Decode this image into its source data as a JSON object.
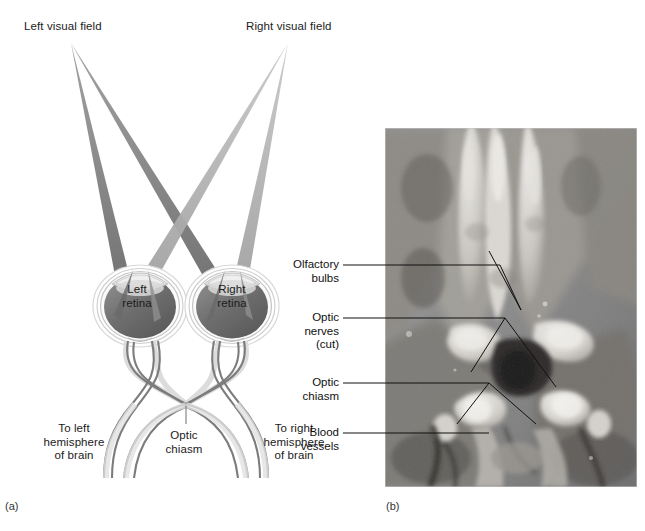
{
  "figure": {
    "panel_a_tag": "(a)",
    "panel_b_tag": "(b)",
    "credit": "Dr. Dana Copeland"
  },
  "diagram": {
    "labels": {
      "left_visual_field": "Left visual field",
      "right_visual_field": "Right visual field",
      "left_retina": "Left\nretina",
      "right_retina": "Right\nretina",
      "to_left_hemisphere": "To left\nhemisphere\nof brain",
      "optic_chiasm": "Optic\nchiasm",
      "to_right_hemisphere": "To right\nhemisphere\nof brain"
    },
    "colors": {
      "left_field_ray": "#6f6f6f",
      "right_field_ray": "#a9a9a9",
      "retina_fill": "#6e6e6e",
      "nerve_stroke": "#7a7a7a",
      "eye_outline": "#bdbdbd",
      "text": "#1b1b1b"
    }
  },
  "photo": {
    "labels": [
      {
        "id": "olfactory-bulbs",
        "text": "Olfactory\nbulbs"
      },
      {
        "id": "optic-nerves-cut",
        "text": "Optic\nnerves\n(cut)"
      },
      {
        "id": "optic-chiasm",
        "text": "Optic\nchiasm"
      },
      {
        "id": "blood-vessels",
        "text": "Blood\nvessels"
      }
    ],
    "subject": "ventral view of sheep brain specimen",
    "colors": {
      "leader_line": "#1a1a1a",
      "border": "#c9c9c9"
    }
  }
}
